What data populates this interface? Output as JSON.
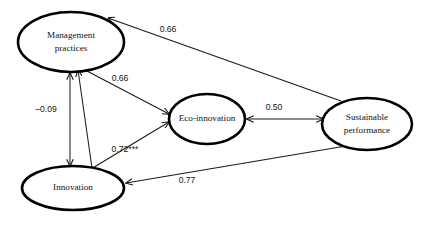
{
  "figure": {
    "type": "path-diagram",
    "background_color": "#ffffff",
    "node_stroke_color": "#000000",
    "edge_color": "#1a1a1a"
  },
  "nodes": [
    {
      "id": "management-practices",
      "label_line1": "Management",
      "label_line2": "practices",
      "cx": 71,
      "cy": 42,
      "rx": 53,
      "ry": 30
    },
    {
      "id": "eco-innovation",
      "label_line1": "Eco-innovation",
      "label_line2": "",
      "cx": 207,
      "cy": 119,
      "rx": 38,
      "ry": 25
    },
    {
      "id": "sustainable-performance",
      "label_line1": "Sustainable",
      "label_line2": "performance",
      "cx": 367,
      "cy": 124,
      "rx": 45,
      "ry": 26
    },
    {
      "id": "innovation",
      "label_line1": "Innovation",
      "label_line2": "",
      "cx": 73,
      "cy": 188,
      "rx": 51,
      "ry": 22
    }
  ],
  "edges": [
    {
      "id": "sustainable-to-management",
      "from": "sustainable-performance",
      "to": "management-practices",
      "coefficient": "0.66",
      "label_x": 168,
      "label_y": 30,
      "arrow": "single"
    },
    {
      "id": "management-to-eco",
      "from": "management-practices",
      "to": "eco-innovation",
      "coefficient": "0.66",
      "label_x": 120,
      "label_y": 79,
      "arrow": "single"
    },
    {
      "id": "management-innovation",
      "from": "management-practices",
      "to": "innovation",
      "coefficient": "–0.09",
      "label_x": 46,
      "label_y": 110,
      "arrow": "double"
    },
    {
      "id": "innovation-to-management-eco",
      "from": "innovation",
      "to": "eco-innovation",
      "coefficient": "0.72***",
      "label_x": 125,
      "label_y": 150,
      "arrow": "single"
    },
    {
      "id": "eco-sustainable",
      "from": "eco-innovation",
      "to": "sustainable-performance",
      "coefficient": "0.50",
      "label_x": 274,
      "label_y": 108,
      "arrow": "double"
    },
    {
      "id": "sustainable-to-innovation",
      "from": "sustainable-performance",
      "to": "innovation",
      "coefficient": "0.77",
      "label_x": 187,
      "label_y": 181,
      "arrow": "single"
    }
  ]
}
